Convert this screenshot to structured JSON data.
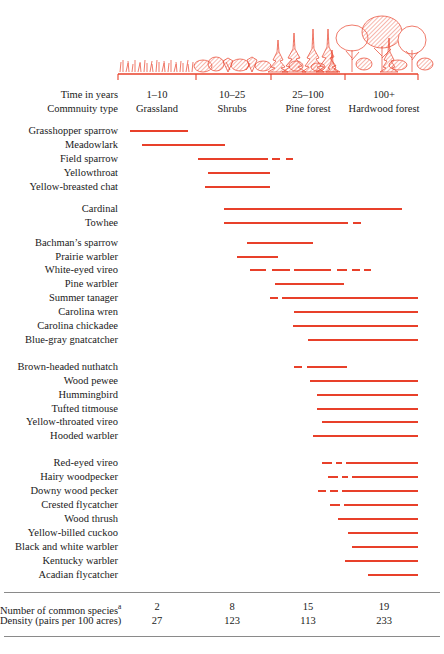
{
  "header": {
    "time_label": "Time in years",
    "community_label": "Commnuity type",
    "columns": [
      {
        "time": "1–10",
        "community": "Grassland",
        "center": 157
      },
      {
        "time": "10–25",
        "community": "Shrubs",
        "center": 232
      },
      {
        "time": "25–100",
        "community": "Pine forest",
        "center": 308
      },
      {
        "time": "100+",
        "community": "Hardwood forest",
        "center": 384
      }
    ]
  },
  "footer": {
    "species_label": "Number of common species",
    "species_superscript": "a",
    "density_label": "Density (pairs per 100 acres)"
  },
  "chart_data": {
    "type": "bar",
    "title": "",
    "xlabel": "Time in years / Community type",
    "ylabel": "Bird species",
    "grid": false,
    "legend": false,
    "accent_color": "#e8402a",
    "axis_ticks_px": [
      118,
      196,
      271,
      345,
      418
    ],
    "x_axis": {
      "stages": [
        "Grassland",
        "Shrubs",
        "Pine forest",
        "Hardwood forest"
      ],
      "time_ranges": [
        "1–10",
        "10–25",
        "25–100",
        "100+"
      ]
    },
    "summary": {
      "number_of_common_species": [
        2,
        8,
        15,
        19
      ],
      "density_pairs_per_100_acres": [
        27,
        123,
        113,
        233
      ]
    },
    "categories": [
      "Grasshopper sparrow",
      "Meadowlark",
      "Field sparrow",
      "Yellowthroat",
      "Yellow-breasted chat",
      "Cardinal",
      "Towhee",
      "Bachman’s sparrow",
      "Prairie warbler",
      "White-eyed vireo",
      "Pine warbler",
      "Summer tanager",
      "Carolina wren",
      "Carolina chickadee",
      "Blue-gray gnatcatcher",
      "Brown-headed nuthatch",
      "Wood pewee",
      "Hummingbird",
      "Tufted titmouse",
      "Yellow-throated vireo",
      "Hooded warbler",
      "Red-eyed vireo",
      "Hairy woodpecker",
      "Downy wood pecker",
      "Crested flycatcher",
      "Wood thrush",
      "Yellow-billed cuckoo",
      "Black and white warbler",
      "Kentucky warbler",
      "Acadian flycatcher"
    ],
    "species": [
      {
        "name": "Grasshopper sparrow",
        "y": 131,
        "segments": [
          [
            130,
            188
          ]
        ]
      },
      {
        "name": "Meadowlark",
        "y": 145,
        "segments": [
          [
            142,
            225
          ]
        ]
      },
      {
        "name": "Field sparrow",
        "y": 159,
        "segments": [
          [
            198,
            268
          ],
          [
            272,
            280
          ],
          [
            286,
            293
          ]
        ]
      },
      {
        "name": "Yellowthroat",
        "y": 173,
        "segments": [
          [
            208,
            270
          ]
        ]
      },
      {
        "name": "Yellow-breasted chat",
        "y": 187,
        "segments": [
          [
            205,
            270
          ]
        ]
      },
      {
        "name": "Cardinal",
        "y": 209,
        "segments": [
          [
            224,
            402
          ]
        ]
      },
      {
        "name": "Towhee",
        "y": 223,
        "segments": [
          [
            224,
            348
          ],
          [
            353,
            361
          ]
        ]
      },
      {
        "name": "Bachman’s sparrow",
        "y": 243,
        "segments": [
          [
            247,
            313
          ]
        ]
      },
      {
        "name": "Prairie warbler",
        "y": 257,
        "segments": [
          [
            237,
            278
          ]
        ]
      },
      {
        "name": "White-eyed vireo",
        "y": 270,
        "segments": [
          [
            250,
            266
          ],
          [
            272,
            290
          ],
          [
            294,
            331
          ],
          [
            337,
            347
          ],
          [
            352,
            360
          ],
          [
            364,
            371
          ]
        ]
      },
      {
        "name": "Pine warbler",
        "y": 284,
        "segments": [
          [
            275,
            344
          ]
        ]
      },
      {
        "name": "Summer tanager",
        "y": 298,
        "segments": [
          [
            270,
            278
          ],
          [
            282,
            418
          ]
        ]
      },
      {
        "name": "Carolina wren",
        "y": 312,
        "segments": [
          [
            294,
            418
          ]
        ]
      },
      {
        "name": "Carolina chickadee",
        "y": 326,
        "segments": [
          [
            293,
            418
          ]
        ]
      },
      {
        "name": "Blue-gray gnatcatcher",
        "y": 340,
        "segments": [
          [
            308,
            418
          ]
        ]
      },
      {
        "name": "Brown-headed nuthatch",
        "y": 367,
        "segments": [
          [
            294,
            302
          ],
          [
            307,
            347
          ]
        ]
      },
      {
        "name": "Wood pewee",
        "y": 381,
        "segments": [
          [
            310,
            418
          ]
        ]
      },
      {
        "name": "Hummingbird",
        "y": 395,
        "segments": [
          [
            317,
            418
          ]
        ]
      },
      {
        "name": "Tufted titmouse",
        "y": 409,
        "segments": [
          [
            317,
            418
          ]
        ]
      },
      {
        "name": "Yellow-throated vireo",
        "y": 422,
        "segments": [
          [
            322,
            418
          ]
        ]
      },
      {
        "name": "Hooded warbler",
        "y": 436,
        "segments": [
          [
            313,
            418
          ]
        ]
      },
      {
        "name": "Red-eyed vireo",
        "y": 463,
        "segments": [
          [
            322,
            332
          ],
          [
            336,
            342
          ],
          [
            346,
            418
          ]
        ]
      },
      {
        "name": "Hairy woodpecker",
        "y": 477,
        "segments": [
          [
            328,
            338
          ],
          [
            342,
            348
          ],
          [
            352,
            418
          ]
        ]
      },
      {
        "name": "Downy wood pecker",
        "y": 491,
        "segments": [
          [
            318,
            326
          ],
          [
            330,
            338
          ],
          [
            342,
            418
          ]
        ]
      },
      {
        "name": "Crested flycatcher",
        "y": 505,
        "segments": [
          [
            330,
            340
          ],
          [
            344,
            418
          ]
        ]
      },
      {
        "name": "Wood thrush",
        "y": 519,
        "segments": [
          [
            338,
            418
          ]
        ]
      },
      {
        "name": "Yellow-billed cuckoo",
        "y": 533,
        "segments": [
          [
            348,
            418
          ]
        ]
      },
      {
        "name": "Black and white warbler",
        "y": 547,
        "segments": [
          [
            352,
            418
          ]
        ]
      },
      {
        "name": "Kentucky warbler",
        "y": 561,
        "segments": [
          [
            345,
            418
          ]
        ]
      },
      {
        "name": "Acadian flycatcher",
        "y": 575,
        "segments": [
          [
            368,
            418
          ]
        ]
      }
    ]
  }
}
